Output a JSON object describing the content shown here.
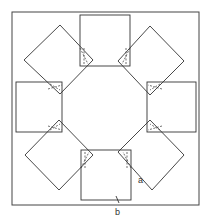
{
  "diagram": {
    "labels": {
      "a": "a",
      "b": "b"
    },
    "colors": {
      "line": "#333333",
      "background": "#ffffff"
    }
  }
}
